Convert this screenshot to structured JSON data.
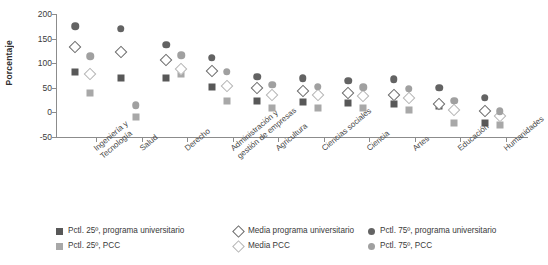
{
  "chart_data": {
    "type": "scatter",
    "title": "",
    "xlabel": "",
    "ylabel": "Porcentaje",
    "ylim": [
      -50,
      200
    ],
    "yticks": [
      200,
      150,
      100,
      50,
      0,
      -50
    ],
    "grid": false,
    "legend_position": "bottom",
    "categories": [
      "Ingeniería y\nTecnología",
      "Salud",
      "Derecho",
      "Administración y\ngestión de empresas",
      "Agricultura",
      "Ciencias sociales",
      "Ciencia",
      "Artes",
      "Educación",
      "Humanidades"
    ],
    "series": [
      {
        "name": "Pctl. 25º, programa universitario",
        "marker": "square",
        "color": "#585858",
        "values": [
          82,
          70,
          69,
          51,
          24,
          22,
          20,
          18,
          14,
          -22
        ]
      },
      {
        "name": "Media programa universitario",
        "marker": "diamond-open",
        "color": "#6a6a6a",
        "values": [
          132,
          122,
          106,
          84,
          50,
          44,
          40,
          36,
          18,
          2
        ]
      },
      {
        "name": "Pctl. 75º, programa universitario",
        "marker": "circle",
        "color": "#636363",
        "values": [
          175,
          170,
          138,
          111,
          72,
          69,
          64,
          67,
          50,
          30
        ]
      },
      {
        "name": "Pctl. 25º, PCC",
        "marker": "square",
        "color": "#a8a8a8",
        "values": [
          40,
          -10,
          78,
          24,
          8,
          9,
          8,
          5,
          -22,
          -25
        ]
      },
      {
        "name": "Media PCC",
        "marker": "diamond-open",
        "color": "#b5b5b5",
        "values": [
          79,
          null,
          88,
          54,
          36,
          35,
          34,
          30,
          5,
          -8
        ]
      },
      {
        "name": "Pctl. 75º, PCC",
        "marker": "circle",
        "color": "#a0a0a0",
        "values": [
          114,
          15,
          116,
          83,
          56,
          52,
          51,
          48,
          24,
          2
        ]
      }
    ]
  },
  "axis": {
    "ylabel": "Porcentaje",
    "yticks": [
      "200",
      "150",
      "100",
      "50",
      "0",
      "-50"
    ]
  },
  "legend": {
    "entries": [
      {
        "label": "Pctl. 25º, programa universitario",
        "marker": "square",
        "color": "#585858",
        "col": 0,
        "row": 0
      },
      {
        "label": "Pctl. 25º, PCC",
        "marker": "square",
        "color": "#a8a8a8",
        "col": 0,
        "row": 1
      },
      {
        "label": "Media programa universitario",
        "marker": "diamond-open",
        "color": "#6a6a6a",
        "col": 1,
        "row": 0
      },
      {
        "label": "Media PCC",
        "marker": "diamond-open",
        "color": "#b5b5b5",
        "col": 1,
        "row": 1
      },
      {
        "label": "Pctl. 75º, programa universitario",
        "marker": "circle",
        "color": "#636363",
        "col": 2,
        "row": 0
      },
      {
        "label": "Pctl. 75º, PCC",
        "marker": "circle",
        "color": "#a0a0a0",
        "col": 2,
        "row": 1
      }
    ]
  }
}
